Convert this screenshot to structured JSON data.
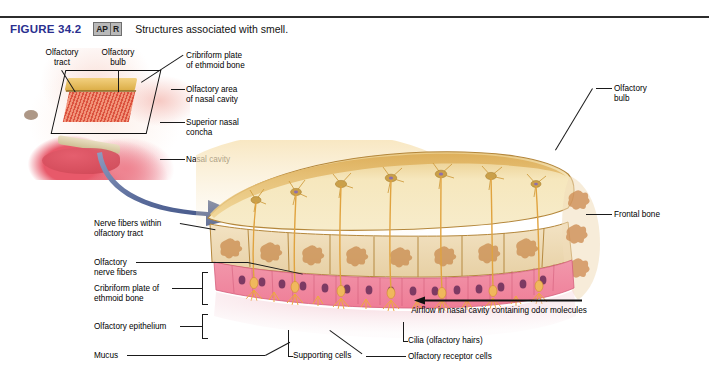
{
  "header": {
    "figure_number": "FIGURE 34.2",
    "badge": {
      "left": "AP",
      "right": "R"
    },
    "caption": "Structures associated with smell."
  },
  "inset_labels": {
    "olfactory_tract": "Olfactory\ntract",
    "olfactory_bulb": "Olfactory\nbulb",
    "cribriform_plate": "Cribriform plate\nof ethmoid bone",
    "olfactory_area": "Olfactory area\nof nasal cavity",
    "superior_concha": "Superior nasal\nconcha",
    "nasal_cavity": "Nasal cavity"
  },
  "main_labels": {
    "nerve_fibers_tract": "Nerve fibers within\nolfactory tract",
    "olfactory_nerve_fibers": "Olfactory\nnerve fibers",
    "cribriform_plate": "Cribriform plate of\nethmoid bone",
    "olfactory_epithelium": "Olfactory epithelium",
    "mucus": "Mucus",
    "supporting_cells": "Supporting cells",
    "cilia": "Cilia (olfactory hairs)",
    "receptor_cells": "Olfactory receptor cells",
    "olfactory_bulb": "Olfactory\nbulb",
    "frontal_bone": "Frontal bone",
    "airflow": "Airflow in nasal cavity\ncontaining odor molecules"
  },
  "icons": {
    "blue_arrow": "curved-arrow-icon",
    "airflow_arrow": "left-arrow-icon"
  },
  "colors": {
    "figure_number": "#2a2f8f",
    "badge_bg": "#b9b9b9",
    "blue_arrow": "#4a5d8f",
    "bone": "#d9a066",
    "epithelium": "#f0849a",
    "bulb": "#f0dba8",
    "nerve": "#e0a33f"
  }
}
